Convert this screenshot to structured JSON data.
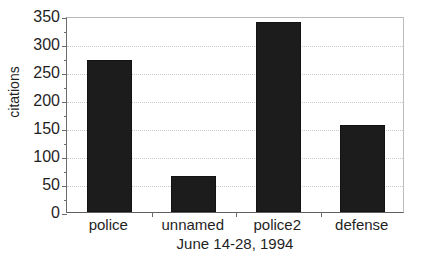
{
  "chart_data": {
    "type": "bar",
    "title": "",
    "subtitle": "",
    "categories": [
      "police",
      "unnamed",
      "police2",
      "defense"
    ],
    "values": [
      272,
      65,
      340,
      155
    ],
    "xlabel": "June 14-28, 1994",
    "ylabel": "citations",
    "ylim": [
      0,
      350
    ],
    "ytick_labels": [
      "350",
      "300",
      "250",
      "200",
      "150",
      "100",
      "50",
      "0"
    ],
    "ytick_values": [
      350,
      300,
      250,
      200,
      150,
      100,
      50,
      0
    ],
    "ytick_interval": 50,
    "grid": true,
    "grid_axis": "y",
    "grid_style": "dotted",
    "legend": false,
    "bar_color": "#1c1c1c",
    "background_color": "#ffffff",
    "axis_color": "#5f5f5f",
    "gridline_color": "#c9c9c9"
  }
}
